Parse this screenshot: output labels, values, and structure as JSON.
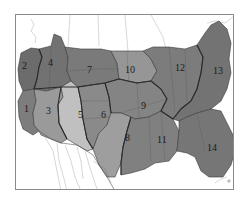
{
  "figure": {
    "type": "regional map"
  },
  "colors": {
    "background": "#ffffff",
    "frame": "#8a8a8a",
    "region_dark": "#6e6e6e",
    "region_mid": "#858585",
    "region_light": "#a8a8a8",
    "region_lightest": "#c2c2c2",
    "land_outline": "#555555"
  },
  "regions": [
    {
      "id": 1,
      "label": "1",
      "shade": "#7d7d7d"
    },
    {
      "id": 2,
      "label": "2",
      "shade": "#6c6c6c"
    },
    {
      "id": 3,
      "label": "3",
      "shade": "#9a9a9a"
    },
    {
      "id": 4,
      "label": "4",
      "shade": "#727272"
    },
    {
      "id": 5,
      "label": "5",
      "shade": "#c0c0c0"
    },
    {
      "id": 6,
      "label": "6",
      "shade": "#8a8a8a"
    },
    {
      "id": 7,
      "label": "7",
      "shade": "#7a7a7a"
    },
    {
      "id": 8,
      "label": "8",
      "shade": "#9e9e9e"
    },
    {
      "id": 9,
      "label": "9",
      "shade": "#848484"
    },
    {
      "id": 10,
      "label": "10",
      "shade": "#969696"
    },
    {
      "id": 11,
      "label": "11",
      "shade": "#808080"
    },
    {
      "id": 12,
      "label": "12",
      "shade": "#7c7c7c"
    },
    {
      "id": 13,
      "label": "13",
      "shade": "#737373"
    },
    {
      "id": 14,
      "label": "14",
      "shade": "#767676"
    }
  ]
}
